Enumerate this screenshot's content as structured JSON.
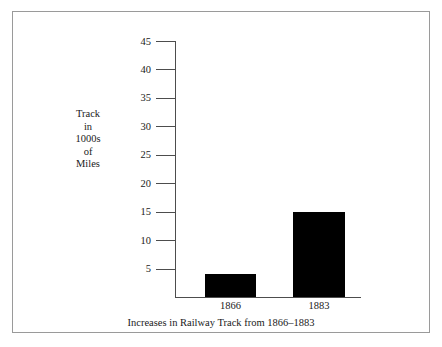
{
  "chart_data": {
    "type": "bar",
    "title": "",
    "subtitle": "",
    "xlabel": "Increases in Railway Track from 1866–1883",
    "ylabel": "Track in 1000s of Miles",
    "ylabel_lines": [
      "Track",
      "in",
      "1000s",
      "of",
      "Miles"
    ],
    "categories": [
      "1866",
      "1883"
    ],
    "values": [
      4,
      15
    ],
    "series": [
      {
        "name": "Track in 1000s of Miles",
        "values": [
          4,
          15
        ],
        "color": "#000000"
      }
    ],
    "ylim": [
      0,
      45
    ],
    "ytick_values": [
      5,
      10,
      15,
      20,
      25,
      30,
      35,
      40,
      45
    ],
    "ytick_labels": [
      "5",
      "10",
      "15",
      "20",
      "25",
      "30",
      "35",
      "40",
      "45"
    ],
    "grid": false,
    "legend": false,
    "legend_position": "none",
    "axis_color": "#4d4d4d",
    "frame_color": "#9a9a9a",
    "background_color": "#ffffff"
  },
  "figure": {
    "caption": "Increases in Railway Track from 1866–1883"
  }
}
